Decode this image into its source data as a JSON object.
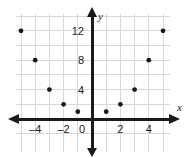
{
  "chart_data": {
    "type": "scatter",
    "title": "",
    "subtitle": "",
    "xlabel": "x",
    "ylabel": "y",
    "x": [
      -5,
      -4,
      -3,
      -2,
      -1,
      1,
      2,
      3,
      4,
      5
    ],
    "values": [
      12,
      8,
      4,
      2,
      1,
      1,
      2,
      4,
      8,
      12
    ],
    "points": [
      {
        "x": -5,
        "y": 12
      },
      {
        "x": -4,
        "y": 8
      },
      {
        "x": -3,
        "y": 4
      },
      {
        "x": -2,
        "y": 2
      },
      {
        "x": -1,
        "y": 1
      },
      {
        "x": 1,
        "y": 1
      },
      {
        "x": 2,
        "y": 2
      },
      {
        "x": 3,
        "y": 4
      },
      {
        "x": 4,
        "y": 8
      },
      {
        "x": 5,
        "y": 12
      }
    ],
    "xlim": [
      -5.6,
      5.6
    ],
    "ylim": [
      -2.6,
      14.2
    ],
    "x_ticks": [
      -4,
      -2,
      0,
      2,
      4
    ],
    "x_tick_labels": [
      "–4",
      "–2",
      "0",
      "2",
      "4"
    ],
    "y_ticks": [
      4,
      8,
      12
    ],
    "y_tick_labels": [
      "4",
      "8",
      "12"
    ],
    "grid": true,
    "grid_step_x": 1,
    "grid_step_y": 2,
    "legend": null,
    "legend_position": "none",
    "colors": {
      "point": "#1a1a1a",
      "axis": "#1a1a1a",
      "grid": "#d8d8d8",
      "background": "#ffffff",
      "text": "#1a1a1a"
    },
    "point_radius": 2.4
  }
}
